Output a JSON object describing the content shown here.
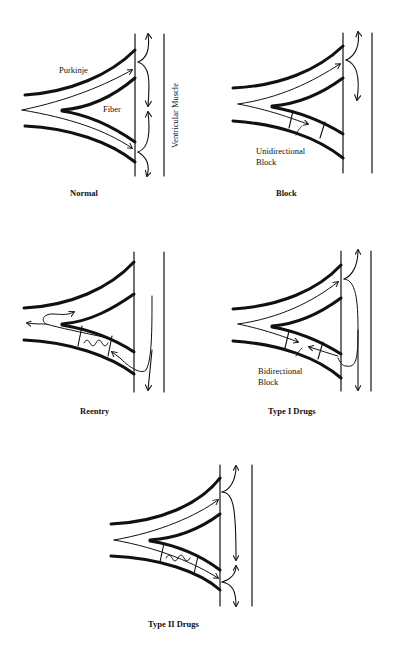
{
  "figure": {
    "panels": [
      {
        "id": "normal",
        "caption": "Normal",
        "labels": {
          "purkinje": "Purkinje",
          "fiber": "Fiber",
          "muscle": "Ventricular Muscle"
        }
      },
      {
        "id": "block",
        "caption": "Block",
        "labels": {
          "block": "Unidirectional\nBlock"
        }
      },
      {
        "id": "reentry",
        "caption": "Reentry"
      },
      {
        "id": "type1",
        "caption": "Type I Drugs",
        "labels": {
          "block": "Bidirectional\nBlock"
        }
      },
      {
        "id": "type2",
        "caption": "Type II Drugs"
      }
    ]
  },
  "colors": {
    "ink": "#111111",
    "background": "#ffffff"
  }
}
